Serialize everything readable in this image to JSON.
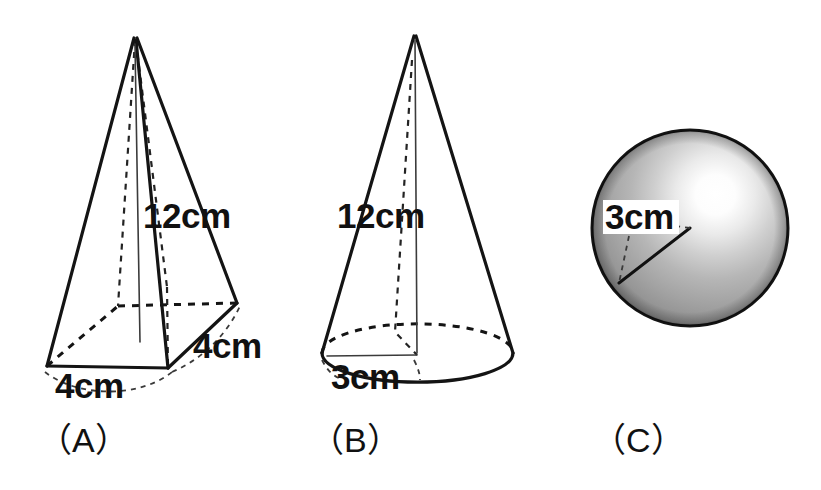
{
  "page": {
    "background_color": "#ffffff",
    "width": 821,
    "height": 490
  },
  "figures": [
    {
      "id": "figure-a",
      "caption": "（A）",
      "shape": "square pyramid",
      "shape_icon": "pyramid-icon",
      "labels": [
        {
          "name": "height",
          "text": "12cm",
          "value": 12,
          "unit": "cm"
        },
        {
          "name": "base-front-edge",
          "text": "4cm",
          "value": 4,
          "unit": "cm"
        },
        {
          "name": "base-right-edge",
          "text": "4cm",
          "value": 4,
          "unit": "cm"
        }
      ]
    },
    {
      "id": "figure-b",
      "caption": "（B）",
      "shape": "cone",
      "shape_icon": "cone-icon",
      "labels": [
        {
          "name": "slant-height",
          "text": "12cm",
          "value": 12,
          "unit": "cm"
        },
        {
          "name": "base-radius",
          "text": "3cm",
          "value": 3,
          "unit": "cm"
        }
      ]
    },
    {
      "id": "figure-c",
      "caption": "（C）",
      "shape": "sphere",
      "shape_icon": "sphere-icon",
      "labels": [
        {
          "name": "radius",
          "text": "3cm",
          "value": 3,
          "unit": "cm"
        }
      ]
    }
  ],
  "colors": {
    "ink": "#141414",
    "hidden_line": "#232323",
    "sphere_light": "#ffffff",
    "sphere_mid": "#b4b4b4",
    "sphere_dark": "#6e6e6e",
    "paper": "#ffffff"
  }
}
